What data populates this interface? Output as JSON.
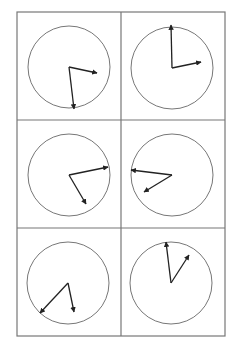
{
  "grid": {
    "left": 17,
    "top": 12,
    "right": 225,
    "bottom": 336,
    "col_divider_x": 121,
    "row_dividers_y": [
      120,
      228
    ],
    "line_color": "#777777"
  },
  "style": {
    "circle_stroke": "#777777",
    "hand_color": "#222222"
  },
  "clocks": [
    {
      "id": "clock-1",
      "cx": 69,
      "cy": 67,
      "r": 41,
      "hands": [
        {
          "x": 97,
          "y": 73
        },
        {
          "x": 74,
          "y": 109
        }
      ]
    },
    {
      "id": "clock-2",
      "cx": 172,
      "cy": 68,
      "r": 41,
      "hands": [
        {
          "x": 171,
          "y": 25
        },
        {
          "x": 201,
          "y": 62
        }
      ]
    },
    {
      "id": "clock-3",
      "cx": 69,
      "cy": 175,
      "r": 41,
      "hands": [
        {
          "x": 108,
          "y": 167
        },
        {
          "x": 86,
          "y": 204
        }
      ]
    },
    {
      "id": "clock-4",
      "cx": 172,
      "cy": 175,
      "r": 41,
      "hands": [
        {
          "x": 131,
          "y": 170
        },
        {
          "x": 144,
          "y": 192
        }
      ]
    },
    {
      "id": "clock-5",
      "cx": 68,
      "cy": 283,
      "r": 41,
      "hands": [
        {
          "x": 40,
          "y": 313
        },
        {
          "x": 74,
          "y": 312
        }
      ]
    },
    {
      "id": "clock-6",
      "cx": 171,
      "cy": 283,
      "r": 41,
      "hands": [
        {
          "x": 166,
          "y": 242
        },
        {
          "x": 189,
          "y": 255
        }
      ]
    }
  ]
}
